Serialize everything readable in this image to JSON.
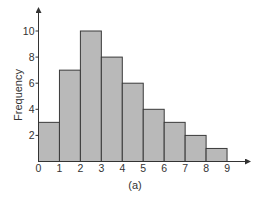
{
  "chart_data": {
    "type": "bar",
    "subtype": "histogram",
    "title": "",
    "caption": "(a)",
    "xlabel": "",
    "ylabel": "Frequency",
    "bin_edges": [
      0,
      1,
      2,
      3,
      4,
      5,
      6,
      7,
      8,
      9
    ],
    "categories": [
      "0-1",
      "1-2",
      "2-3",
      "3-4",
      "4-5",
      "5-6",
      "6-7",
      "7-8",
      "8-9"
    ],
    "values": [
      3,
      7,
      10,
      8,
      6,
      4,
      3,
      2,
      1
    ],
    "x_ticks": [
      "0",
      "1",
      "2",
      "3",
      "4",
      "5",
      "6",
      "7",
      "8",
      "9"
    ],
    "y_ticks": [
      "2",
      "4",
      "6",
      "8",
      "10"
    ],
    "xlim": [
      0,
      9.8
    ],
    "ylim": [
      0,
      11.7
    ],
    "grid": false,
    "legend": null,
    "colors": {
      "bar_fill": "#b9b9b9",
      "bar_stroke": "#3a3a3a",
      "axis": "#333333"
    }
  }
}
